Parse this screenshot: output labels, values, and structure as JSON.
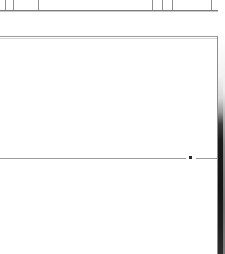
{
  "document": {
    "title": "Clipped document fragment",
    "background_color": "#ffffff"
  },
  "header_strip": {
    "name": "clipped-table-header-row",
    "rule_color": "#7d7d7d",
    "separator_color": "#8e8e8e",
    "height_px": 11,
    "column_separators_x": [
      5,
      13,
      38,
      152,
      162,
      172,
      211,
      219
    ]
  },
  "panel": {
    "name": "content-panel",
    "border_color": "#8d8d8d",
    "background_color": "#ffffff",
    "top_px": 36,
    "right_px": 217,
    "content": ""
  },
  "divider": {
    "name": "horizontal-rule",
    "color": "#9c9c9c",
    "y_px": 158,
    "left_segment_width": 186,
    "right_segment_start": 196,
    "right_segment_width": 21
  },
  "marker": {
    "name": "inline-marker-dot",
    "color": "#2a2a2a",
    "x_px": 189,
    "y_px": 156,
    "size_px": 3
  },
  "edge_band": {
    "name": "page-edge-shadow",
    "color_top": "#ffffff",
    "color_bottom": "#141414",
    "x_px": 218,
    "width_px": 7
  }
}
